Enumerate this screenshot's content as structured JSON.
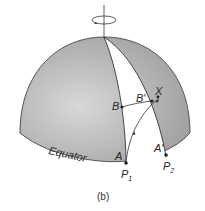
{
  "figure": {
    "caption": "(b)",
    "colors": {
      "shade": "#a9a9a9",
      "shade_light": "#d6d6d6",
      "line": "#333333",
      "white": "#ffffff"
    },
    "labels": {
      "equator": "Equator",
      "A": "A",
      "A_prime": "A′",
      "B": "B",
      "B_prime": "B′",
      "X": "X",
      "P1": "P",
      "P1_sub": "1",
      "P2": "P",
      "P2_sub": "2"
    },
    "icons": [
      "rotation-arrow-icon"
    ]
  }
}
